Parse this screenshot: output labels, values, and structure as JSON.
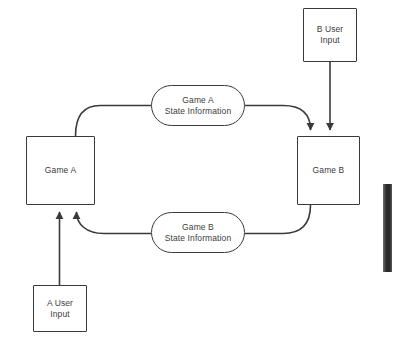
{
  "diagram": {
    "background_color": "#ffffff",
    "stroke_color": "#3a3a3a",
    "text_color": "#3d3d3d",
    "nodes": [
      {
        "id": "game-a",
        "label": "Game A",
        "shape": "rectangle",
        "x": 26,
        "y": 136,
        "w": 69,
        "h": 69
      },
      {
        "id": "game-b",
        "label": "Game B",
        "shape": "rectangle",
        "x": 297,
        "y": 136,
        "w": 63,
        "h": 69
      },
      {
        "id": "a-user-input",
        "label": "A User\nInput",
        "shape": "rectangle",
        "x": 33,
        "y": 285,
        "w": 54,
        "h": 47
      },
      {
        "id": "b-user-input",
        "label": "B User\nInput",
        "shape": "rectangle",
        "x": 303,
        "y": 8,
        "w": 54,
        "h": 54
      },
      {
        "id": "game-a-state-information",
        "label": "Game A\nState Information",
        "shape": "rounded-rectangle",
        "x": 151,
        "y": 85,
        "w": 94,
        "h": 41
      },
      {
        "id": "game-b-state-information",
        "label": "Game B\nState Information",
        "shape": "rounded-rectangle",
        "x": 151,
        "y": 212,
        "w": 94,
        "h": 41
      }
    ],
    "connectors": [
      {
        "id": "game-a-to-state-a",
        "from": "game-a",
        "to": "game-a-state-information",
        "arrowhead": false
      },
      {
        "id": "state-a-to-game-b",
        "from": "game-a-state-information",
        "to": "game-b",
        "arrowhead": true
      },
      {
        "id": "game-b-to-state-b",
        "from": "game-b",
        "to": "game-b-state-information",
        "arrowhead": false
      },
      {
        "id": "state-b-to-game-a",
        "from": "game-b-state-information",
        "to": "game-a",
        "arrowhead": true
      },
      {
        "id": "b-user-input-to-game-b",
        "from": "b-user-input",
        "to": "game-b",
        "arrowhead": true
      },
      {
        "id": "a-user-input-to-game-a",
        "from": "a-user-input",
        "to": "game-a",
        "arrowhead": true
      }
    ]
  },
  "scroll_indicator": {
    "name": "vertical-scrollbar-thumb",
    "x": 383,
    "y": 184,
    "w": 9,
    "h": 88,
    "color": "#2e2e2e"
  }
}
